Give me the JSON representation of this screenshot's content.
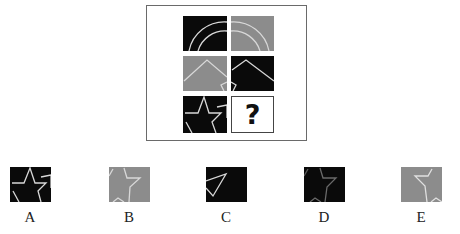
{
  "puzzle": {
    "question_mark": "?",
    "colors": {
      "dark": "#0a0a0a",
      "gray": "#8c8c8c",
      "line": "#d8d8d8",
      "frame": "#6a6a6a"
    },
    "grid": [
      {
        "row": 1,
        "col": 1,
        "bg": "dark",
        "motif": "double-arc"
      },
      {
        "row": 1,
        "col": 2,
        "bg": "gray",
        "motif": "double-arc"
      },
      {
        "row": 2,
        "col": 1,
        "bg": "gray",
        "motif": "chevron-roof"
      },
      {
        "row": 2,
        "col": 2,
        "bg": "dark",
        "motif": "chevron-roof"
      },
      {
        "row": 3,
        "col": 1,
        "bg": "dark",
        "motif": "star-outline"
      },
      {
        "row": 3,
        "col": 2,
        "bg": "blank",
        "motif": "question-mark"
      }
    ]
  },
  "options": [
    {
      "label": "A",
      "bg": "dark",
      "motif": "star-outline"
    },
    {
      "label": "B",
      "bg": "gray",
      "motif": "star-partial"
    },
    {
      "label": "C",
      "bg": "dark",
      "motif": "triangle"
    },
    {
      "label": "D",
      "bg": "dark",
      "motif": "star-partial"
    },
    {
      "label": "E",
      "bg": "gray",
      "motif": "star-partial"
    }
  ]
}
